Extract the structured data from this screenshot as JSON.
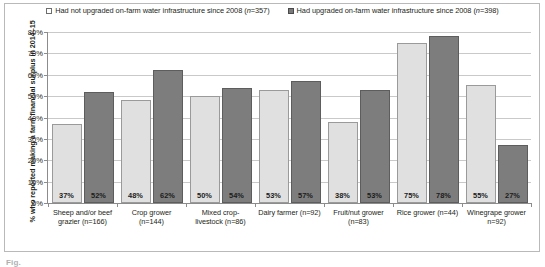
{
  "chart_data": {
    "type": "bar",
    "title": "",
    "xlabel": "",
    "ylabel": "% who reported making a farm financial surplus in 2014–15",
    "ylim": [
      0,
      80
    ],
    "ytick_labels": [
      "0%",
      "10%",
      "20%",
      "30%",
      "40%",
      "50%",
      "60%",
      "70%",
      "80%"
    ],
    "ytick_values": [
      0,
      10,
      20,
      30,
      40,
      50,
      60,
      70,
      80
    ],
    "grid": true,
    "legend_position": "top-center",
    "categories": [
      "Sheep and/or beef grazier (n=166)",
      "Crop grower (n=144)",
      "Mixed crop-livestock (n=86)",
      "Dairy farmer (n=92)",
      "Fruit/nut grower (n=83)",
      "Rice grower (n=44)",
      "Winegrape grower n=92)"
    ],
    "category_lines": [
      [
        "Sheep and/or beef",
        "grazier (n=166)"
      ],
      [
        "Crop grower",
        "(n=144)"
      ],
      [
        "Mixed crop-",
        "livestock (n=86)"
      ],
      [
        "Dairy farmer (n=92)"
      ],
      [
        "Fruit/nut grower",
        "(n=83)"
      ],
      [
        "Rice grower (n=44)"
      ],
      [
        "Winegrape grower",
        "n=92)"
      ]
    ],
    "series": [
      {
        "name": "Had not upgraded on-farm water infrastructure since 2008 (n=357)",
        "short_name": "not-upgraded",
        "color": "#e0e0e0",
        "values": [
          37,
          48,
          50,
          53,
          38,
          75,
          55
        ],
        "labels": [
          "37%",
          "48%",
          "50%",
          "53%",
          "38%",
          "75%",
          "55%"
        ]
      },
      {
        "name": "Had upgraded on-farm water infrastructure since 2008 (n=398)",
        "short_name": "upgraded",
        "color": "#7d7d7d",
        "values": [
          52,
          62,
          54,
          57,
          53,
          78,
          27
        ],
        "labels": [
          "52%",
          "62%",
          "54%",
          "57%",
          "53%",
          "78%",
          "27%"
        ]
      }
    ]
  },
  "legend": {
    "entries": [
      {
        "label_before": "Had not upgraded on-farm water infrastructure since 2008 (",
        "label_italic": "n",
        "label_after": "=357)",
        "marker": "open-square-swatch"
      },
      {
        "label_before": "Had upgraded on-farm water infrastructure since 2008 (",
        "label_italic": "n",
        "label_after": "=398)",
        "marker": "filled-square-swatch"
      }
    ]
  },
  "caption": {
    "clipped_text": "Fig."
  }
}
